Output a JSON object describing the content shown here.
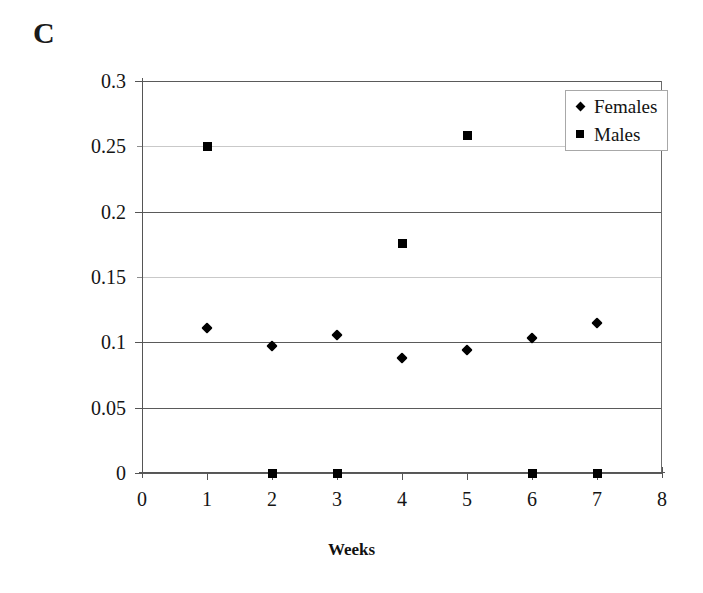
{
  "figure": {
    "panel_label": "C",
    "background_color": "#ffffff",
    "marker_color": "#000000",
    "gridline_major_color": "#5a5a5a",
    "gridline_minor_color": "#c9c9c9",
    "axis_color": "#555555"
  },
  "chart_data": {
    "type": "scatter",
    "title": "C",
    "xlabel": "Weeks",
    "ylabel": "Risk of Dying",
    "xlim": [
      0,
      8
    ],
    "ylim": [
      0,
      0.3
    ],
    "xticks": [
      0,
      1,
      2,
      3,
      4,
      5,
      6,
      7,
      8
    ],
    "xticklabels": [
      "0",
      "1",
      "2",
      "3",
      "4",
      "5",
      "6",
      "7",
      "8"
    ],
    "yticks": [
      0,
      0.05,
      0.1,
      0.15,
      0.2,
      0.25,
      0.3
    ],
    "yticklabels": [
      "0",
      "0.05",
      "0.1",
      "0.15",
      "0.2",
      "0.25",
      "0.3"
    ],
    "grid": "horizontal",
    "grid_major_values": [
      0,
      0.05,
      0.1,
      0.2,
      0.3
    ],
    "grid_minor_values": [
      0.15,
      0.25
    ],
    "legend_position": "top-right",
    "x": [
      1,
      2,
      3,
      4,
      5,
      6,
      7
    ],
    "series": [
      {
        "name": "Females",
        "marker": "diamond",
        "color": "#000000",
        "x": [
          1,
          2,
          3,
          4,
          5,
          6,
          7
        ],
        "values": [
          0.111,
          0.097,
          0.106,
          0.088,
          0.094,
          0.103,
          0.115
        ]
      },
      {
        "name": "Males",
        "marker": "square",
        "color": "#000000",
        "x": [
          1,
          2,
          3,
          4,
          5,
          6,
          7
        ],
        "values": [
          0.25,
          0.0,
          0.0,
          0.176,
          0.258,
          0.0,
          0.0
        ]
      }
    ]
  },
  "legend": {
    "entries": [
      {
        "label": "Females",
        "marker": "diamond"
      },
      {
        "label": "Males",
        "marker": "square"
      }
    ]
  }
}
